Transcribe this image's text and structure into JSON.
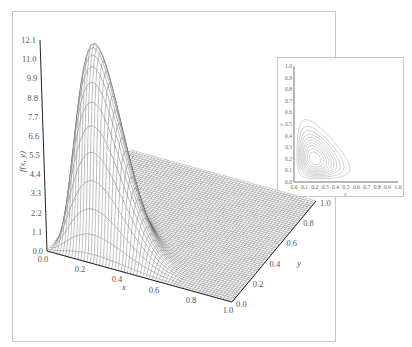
{
  "chart_data": [
    {
      "type": "surface",
      "title": "",
      "description": "3D wireframe surface plot of a bivariate density f(x, y) (Dirichlet-like, supported on x + y <= 1), single peak near x=0.2, y=0.22",
      "xlabel": "x",
      "ylabel": "y",
      "zlabel": "f(x, y)",
      "x_ticks": [
        "0.0",
        "0.2",
        "0.4",
        "0.6",
        "0.8",
        "1.0"
      ],
      "y_ticks": [
        "0.0",
        "0.2",
        "0.4",
        "0.6",
        "0.8",
        "1.0"
      ],
      "z_ticks": [
        "0.0",
        "1.1",
        "2.2",
        "3.3",
        "4.4",
        "5.5",
        "6.6",
        "7.7",
        "8.8",
        "9.9",
        "11.0",
        "12.1"
      ],
      "xlim": [
        0.0,
        1.0
      ],
      "ylim": [
        0.0,
        1.0
      ],
      "zlim": [
        0.0,
        12.1
      ],
      "peak": {
        "x": 0.2,
        "y": 0.22,
        "z": 11.3
      },
      "grid": false,
      "line_color": "#333333"
    },
    {
      "type": "contour",
      "title": "",
      "description": "Inset contour plot of the same density",
      "xlabel": "x",
      "ylabel": "y",
      "x_ticks": [
        "0.0",
        "0.1",
        "0.2",
        "0.3",
        "0.4",
        "0.5",
        "0.6",
        "0.7",
        "0.8",
        "0.9",
        "1.0"
      ],
      "y_ticks": [
        "0.0",
        "0.1",
        "0.2",
        "0.3",
        "0.4",
        "0.5",
        "0.6",
        "0.7",
        "0.8",
        "0.9",
        "1.0"
      ],
      "xlim": [
        0.0,
        1.0
      ],
      "ylim": [
        0.0,
        1.0
      ],
      "contour_levels": 10,
      "center": {
        "x": 0.2,
        "y": 0.22
      },
      "outer_extent": {
        "x_max": 0.6,
        "y_max": 0.57
      },
      "line_color": "#aaaaaa"
    }
  ],
  "labels": {
    "x": "x",
    "y": "y",
    "z": "f(x, y)",
    "inset_x": "x",
    "inset_y": "y"
  }
}
